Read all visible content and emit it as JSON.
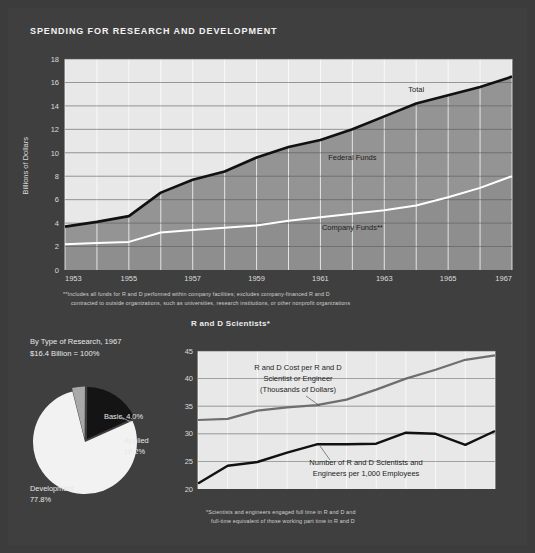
{
  "page": {
    "title": "SPENDING FOR RESEARCH AND DEVELOPMENT",
    "bg_color": "#3f3f3f",
    "panel_color": "#e8e8e8",
    "band_color": "#949494",
    "line_total_color": "#111111",
    "line_company_color": "#ffffff"
  },
  "footnote_main_line1": "**Includes all funds for R and D performed within company facilities; excludes company-financed R and D",
  "footnote_main_line2": "contracted to outside organizations, such as universities, research institutions, or other nonprofit organizations",
  "footnote_sci_line1": "*Scientists and engineers engaged full time in R and D and",
  "footnote_sci_line2": "full-time equivalent of those working part time in R and D",
  "pie_panel": {
    "heading_line1": "By Type of Research, 1967",
    "heading_line2": "$16.4 Billion = 100%",
    "label_basic": "Basic, 4.0%",
    "label_applied_line1": "Applied",
    "label_applied_line2": "18.2%",
    "label_development_line1": "Development",
    "label_development_line2": "77.8%"
  },
  "sci_panel": {
    "title": "R and D Scientists*",
    "annotation_cost_line1": "R and D Cost per R and D",
    "annotation_cost_line2": "Scientist or Engineer",
    "annotation_cost_line3": "(Thousands of Dollars)",
    "annotation_num_line1": "Number of R and D Scientists and",
    "annotation_num_line2": "Engineers per 1,000 Employees",
    "est_label": "(est.)"
  },
  "chart_data": [
    {
      "type": "area",
      "id": "spending",
      "title": "SPENDING FOR RESEARCH AND DEVELOPMENT",
      "xlabel": "",
      "ylabel": "Billions of Dollars",
      "ylim": [
        0,
        18
      ],
      "yticks": [
        0,
        2,
        4,
        6,
        8,
        10,
        12,
        14,
        16,
        18
      ],
      "xlim": [
        1953,
        1967
      ],
      "x": [
        1953,
        1954,
        1955,
        1956,
        1957,
        1958,
        1959,
        1960,
        1961,
        1962,
        1963,
        1964,
        1965,
        1966,
        1967
      ],
      "xticks": [
        1953,
        1955,
        1957,
        1959,
        1961,
        1963,
        1965,
        1967
      ],
      "xticklabels": [
        "1953",
        "1955",
        "1957",
        "1959",
        "1961",
        "1963",
        "1965",
        "1967"
      ],
      "grid": true,
      "series": [
        {
          "name": "Total",
          "label": "Total",
          "color": "#111111",
          "values": [
            3.7,
            4.1,
            4.6,
            6.6,
            7.7,
            8.4,
            9.6,
            10.5,
            11.1,
            12.0,
            13.1,
            14.2,
            14.9,
            15.6,
            16.5
          ]
        },
        {
          "name": "Company Funds**",
          "label": "Company Funds**",
          "color": "#ffffff",
          "values": [
            2.2,
            2.3,
            2.4,
            3.2,
            3.4,
            3.6,
            3.8,
            4.2,
            4.5,
            4.8,
            5.1,
            5.5,
            6.2,
            7.0,
            8.0
          ]
        }
      ],
      "band_label": "Federal Funds",
      "annotations": [
        {
          "text": "Total",
          "x": 1964,
          "y": 15.2
        },
        {
          "text": "Federal Funds",
          "x": 1962,
          "y": 9.4
        },
        {
          "text": "Company Funds**",
          "x": 1962,
          "y": 3.4
        }
      ]
    },
    {
      "type": "line",
      "id": "scientists",
      "title": "R and D Scientists*",
      "xlabel": "",
      "ylabel": "",
      "ylim": [
        20,
        45
      ],
      "yticks": [
        20,
        25,
        30,
        35,
        40,
        45
      ],
      "xlim": [
        1957,
        1967
      ],
      "x": [
        1957,
        1958,
        1959,
        1960,
        1961,
        1962,
        1963,
        1964,
        1965,
        1966,
        1967
      ],
      "xticks": [
        1957,
        1959,
        1961,
        1963,
        1965,
        1967
      ],
      "xticklabels": [
        "'57",
        "'59",
        "'61",
        "'63",
        "'65",
        "'67"
      ],
      "grid": true,
      "series": [
        {
          "name": "R and D Cost per R and D Scientist or Engineer (Thousands of Dollars)",
          "color": "#6e6e6e",
          "values": [
            32.5,
            32.7,
            34.2,
            34.8,
            35.2,
            36.2,
            38.0,
            40.0,
            41.6,
            43.4,
            44.2
          ]
        },
        {
          "name": "Number of R and D Scientists and Engineers per 1,000 Employees",
          "color": "#111111",
          "values": [
            21.0,
            24.2,
            24.9,
            26.6,
            28.1,
            28.1,
            28.2,
            30.2,
            30.0,
            28.0,
            30.5
          ]
        }
      ]
    },
    {
      "type": "pie",
      "id": "by-type-of-research",
      "title": "By Type of Research, 1967",
      "subtitle": "$16.4 Billion = 100%",
      "labels": [
        "Basic",
        "Applied",
        "Development"
      ],
      "values": [
        4.0,
        18.2,
        77.8
      ],
      "colors": [
        "#a8a8a8",
        "#141414",
        "#f2f2f2"
      ],
      "total_label": "$16.4 Billion = 100%"
    }
  ]
}
